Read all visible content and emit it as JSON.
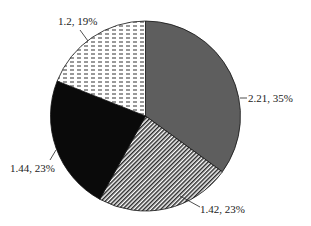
{
  "chart_data": {
    "type": "pie",
    "title": "",
    "start_angle_deg": 0,
    "direction": "clockwise",
    "slices": [
      {
        "label": "2.21, 35%",
        "value": 2.21,
        "percent": 35,
        "fill": "gray",
        "color": "#5e5e5e"
      },
      {
        "label": "1.42, 23%",
        "value": 1.42,
        "percent": 23,
        "fill": "diagonal-stripes",
        "color": "#8a8a8a"
      },
      {
        "label": "1.44, 23%",
        "value": 1.44,
        "percent": 23,
        "fill": "solid-black",
        "color": "#0a0a0a"
      },
      {
        "label": "1.2, 19%",
        "value": 1.2,
        "percent": 19,
        "fill": "horizontal-dashes",
        "color": "#ffffff"
      }
    ],
    "legend": "none",
    "grid": false
  },
  "labels": {
    "slice0": "2.21, 35%",
    "slice1": "1.42, 23%",
    "slice2": "1.44, 23%",
    "slice3": "1.2, 19%"
  }
}
